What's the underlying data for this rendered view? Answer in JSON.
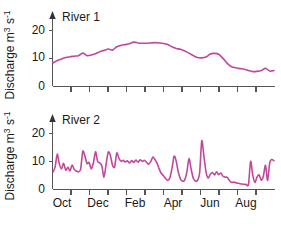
{
  "figure": {
    "background": "#ffffff",
    "line_color": "#c2479b",
    "axis_color": "#555555",
    "text_color": "#1a1a1a"
  },
  "panels": [
    {
      "id": "river1",
      "title": "River 1",
      "y_axis_label": "Discharge m",
      "y_axis_label_sup1": "3",
      "y_axis_label_mid": " s",
      "y_axis_label_sup2": "-1",
      "y_ticks": [
        0,
        10,
        20
      ],
      "x_tick_labels": [],
      "x_tick_count": 12
    },
    {
      "id": "river2",
      "title": "River 2",
      "y_axis_label": "Discharge m",
      "y_axis_label_sup1": "3",
      "y_axis_label_mid": " s",
      "y_axis_label_sup2": "-1",
      "y_ticks": [
        0,
        10,
        20
      ],
      "x_tick_labels": [
        "Oct",
        "Dec",
        "Feb",
        "Apr",
        "Jun",
        "Aug"
      ],
      "x_tick_count": 12
    }
  ],
  "chart_data": [
    {
      "type": "line",
      "title": "River 1",
      "xlabel": "",
      "ylabel": "Discharge m3 s-1",
      "ylim": [
        0,
        23
      ],
      "xlim": [
        0,
        52
      ],
      "yticks": [
        0,
        10,
        20
      ],
      "xticks": [],
      "xtick_labels": [],
      "grid": false,
      "legend": "none",
      "series": [
        {
          "name": "River 1",
          "color": "#c2479b",
          "x": [
            0,
            1,
            2,
            3,
            4,
            5,
            6,
            7,
            8,
            9,
            10,
            11,
            12,
            13,
            14,
            15,
            16,
            17,
            18,
            19,
            20,
            21,
            22,
            23,
            24,
            25,
            26,
            27,
            28,
            29,
            30,
            31,
            32,
            33,
            34,
            35,
            36,
            37,
            38,
            39,
            40,
            41,
            42,
            43,
            44,
            45,
            46,
            47,
            48,
            49,
            50,
            51,
            52
          ],
          "y": [
            8.4,
            9.2,
            9.8,
            10.3,
            10.6,
            10.8,
            11.0,
            11.9,
            11.0,
            11.2,
            11.7,
            12.4,
            12.9,
            13.4,
            13.0,
            14.2,
            14.7,
            15.0,
            15.3,
            15.9,
            15.6,
            15.5,
            15.5,
            15.6,
            15.7,
            15.6,
            15.4,
            15.0,
            14.2,
            13.6,
            13.3,
            12.7,
            11.9,
            11.0,
            10.3,
            10.2,
            10.5,
            11.6,
            11.8,
            11.5,
            10.0,
            8.2,
            7.0,
            6.6,
            6.3,
            6.1,
            5.6,
            5.2,
            5.3,
            5.6,
            6.4,
            5.4,
            5.6
          ]
        }
      ]
    },
    {
      "type": "line",
      "title": "River 2",
      "xlabel": "",
      "ylabel": "Discharge m3 s-1",
      "ylim": [
        0,
        23
      ],
      "xlim": [
        0,
        104
      ],
      "yticks": [
        0,
        10,
        20
      ],
      "xticks": [
        0,
        8.7,
        17.3,
        26.0,
        34.7,
        43.3,
        52.0,
        60.7,
        69.3,
        78.0,
        86.7,
        95.3,
        104
      ],
      "xtick_labels": [
        "Oct",
        "Dec",
        "Feb",
        "Apr",
        "Jun",
        "Aug"
      ],
      "xtick_label_positions": [
        2.5,
        21.5,
        41.0,
        60.5,
        79.5,
        97.0
      ],
      "grid": false,
      "legend": "none",
      "series": [
        {
          "name": "River 2",
          "color": "#c2479b",
          "x": [
            0,
            1,
            2,
            3,
            4,
            5,
            6,
            7,
            8,
            9,
            10,
            11,
            12,
            13,
            14,
            15,
            16,
            17,
            18,
            19,
            20,
            21,
            22,
            23,
            24,
            25,
            26,
            27,
            28,
            29,
            30,
            31,
            32,
            33,
            34,
            35,
            36,
            37,
            38,
            39,
            40,
            41,
            42,
            43,
            44,
            45,
            46,
            47,
            48,
            49,
            50,
            51,
            52,
            53,
            54,
            55,
            56,
            57,
            58,
            59,
            60,
            61,
            62,
            63,
            64,
            65,
            66,
            67,
            68,
            69,
            70,
            71,
            72,
            73,
            74,
            75,
            76,
            77,
            78,
            79,
            80,
            81,
            82,
            83,
            84,
            85,
            86,
            87,
            88,
            89,
            90,
            91,
            92,
            93,
            94,
            95,
            96,
            97,
            98,
            99,
            100,
            101,
            102,
            103,
            104
          ],
          "y": [
            6.2,
            8.0,
            12.6,
            9.0,
            7.3,
            9.3,
            6.8,
            7.9,
            6.6,
            8.7,
            7.1,
            6.5,
            6.2,
            7.2,
            13.6,
            12.0,
            9.2,
            9.6,
            7.3,
            9.4,
            13.5,
            10.0,
            9.5,
            8.3,
            4.3,
            9.0,
            13.4,
            12.1,
            8.6,
            8.0,
            13.0,
            11.2,
            10.1,
            10.4,
            9.8,
            10.2,
            9.4,
            10.3,
            9.6,
            10.5,
            9.7,
            10.6,
            10.0,
            10.4,
            9.7,
            9.0,
            9.9,
            11.6,
            10.6,
            9.3,
            7.2,
            5.6,
            4.8,
            3.8,
            3.1,
            4.1,
            7.5,
            11.9,
            10.0,
            6.0,
            3.6,
            2.8,
            3.3,
            6.2,
            11.0,
            7.2,
            4.0,
            2.9,
            3.1,
            5.8,
            17.4,
            12.0,
            6.2,
            4.0,
            5.3,
            6.0,
            5.1,
            6.2,
            5.2,
            5.8,
            4.6,
            4.3,
            4.2,
            3.1,
            2.4,
            2.5,
            2.3,
            2.1,
            1.9,
            1.8,
            1.7,
            1.6,
            1.7,
            10.0,
            5.0,
            2.4,
            4.3,
            5.1,
            3.2,
            4.6,
            8.6,
            3.1,
            9.6,
            10.7,
            10.2
          ]
        }
      ]
    }
  ]
}
